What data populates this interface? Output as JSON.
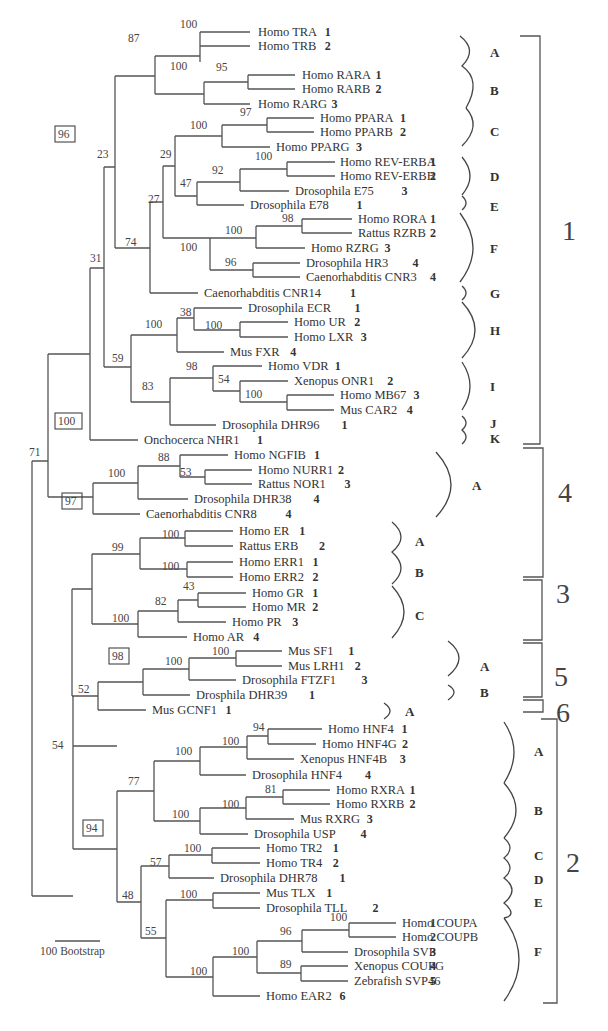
{
  "figure": {
    "type": "phylogenetic-tree",
    "scale_bar_label": "100 Bootstrap"
  },
  "taxa": [
    {
      "name": "Homo TRA",
      "num": "1",
      "y": 32,
      "x": 258
    },
    {
      "name": "Homo TRB",
      "num": "2",
      "y": 46,
      "x": 258
    },
    {
      "name": "Homo RARA",
      "num": "1",
      "y": 75,
      "x": 302
    },
    {
      "name": "Homo RARB",
      "num": "2",
      "y": 89,
      "x": 302
    },
    {
      "name": "Homo RARG",
      "num": "3",
      "y": 104,
      "x": 258
    },
    {
      "name": "Homo PPARA",
      "num": "1",
      "y": 118,
      "x": 320
    },
    {
      "name": "Homo PPARB",
      "num": "2",
      "y": 132,
      "x": 320
    },
    {
      "name": "Homo PPARG",
      "num": "3",
      "y": 147,
      "x": 276
    },
    {
      "name": "Homo REV-ERBA",
      "num": "1",
      "y": 162,
      "x": 340
    },
    {
      "name": "Homo REV-ERBB",
      "num": "2",
      "y": 176,
      "x": 340
    },
    {
      "name": "Drosophila E75",
      "num": "3",
      "y": 191,
      "x": 295
    },
    {
      "name": "Drosophila E78",
      "num": "1",
      "y": 205,
      "x": 250
    },
    {
      "name": "Homo RORA",
      "num": "1",
      "y": 219,
      "x": 358
    },
    {
      "name": "Rattus RZRB",
      "num": "2",
      "y": 233,
      "x": 358
    },
    {
      "name": "Homo RZRG",
      "num": "3",
      "y": 248,
      "x": 311
    },
    {
      "name": "Drosophila HR3",
      "num": "4",
      "y": 263,
      "x": 306
    },
    {
      "name": "Caenorhabditis CNR3",
      "num": "4",
      "y": 277,
      "x": 306
    },
    {
      "name": "Caenorhabditis CNR14",
      "num": "1",
      "y": 293,
      "x": 204
    },
    {
      "name": "Drosophila ECR",
      "num": "1",
      "y": 308,
      "x": 248
    },
    {
      "name": "Homo UR",
      "num": "2",
      "y": 322,
      "x": 294
    },
    {
      "name": "Homo LXR",
      "num": "3",
      "y": 337,
      "x": 294
    },
    {
      "name": "Mus FXR",
      "num": "4",
      "y": 352,
      "x": 230
    },
    {
      "name": "Homo VDR",
      "num": "1",
      "y": 366,
      "x": 268
    },
    {
      "name": "Xenopus ONR1",
      "num": "2",
      "y": 381,
      "x": 294
    },
    {
      "name": "Homo MB67",
      "num": "3",
      "y": 395,
      "x": 340
    },
    {
      "name": "Mus CAR2",
      "num": "4",
      "y": 410,
      "x": 340
    },
    {
      "name": "Drosophila DHR96",
      "num": "1",
      "y": 425,
      "x": 222
    },
    {
      "name": "Onchocerca NHR1",
      "num": "1",
      "y": 440,
      "x": 144
    },
    {
      "name": "Homo NGFIB",
      "num": "1",
      "y": 455,
      "x": 234
    },
    {
      "name": "Homo NURR1",
      "num": "2",
      "y": 470,
      "x": 258
    },
    {
      "name": "Rattus NOR1",
      "num": "3",
      "y": 484,
      "x": 258
    },
    {
      "name": "Drosophila DHR38",
      "num": "4",
      "y": 499,
      "x": 194
    },
    {
      "name": "Caenorhabditis CNR8",
      "num": "4",
      "y": 514,
      "x": 146
    },
    {
      "name": "Homo ER",
      "num": "1",
      "y": 531,
      "x": 239
    },
    {
      "name": "Rattus ERB",
      "num": "2",
      "y": 546,
      "x": 239
    },
    {
      "name": "Homo ERR1",
      "num": "1",
      "y": 562,
      "x": 239
    },
    {
      "name": "Homo ERR2",
      "num": "2",
      "y": 577,
      "x": 239
    },
    {
      "name": "Homo GR",
      "num": "1",
      "y": 593,
      "x": 252
    },
    {
      "name": "Homo MR",
      "num": "2",
      "y": 607,
      "x": 252
    },
    {
      "name": "Homo PR",
      "num": "3",
      "y": 622,
      "x": 232
    },
    {
      "name": "Homo AR",
      "num": "4",
      "y": 637,
      "x": 193
    },
    {
      "name": "Mus SF1",
      "num": "1",
      "y": 651,
      "x": 288
    },
    {
      "name": "Mus LRH1",
      "num": "2",
      "y": 666,
      "x": 288
    },
    {
      "name": "Drosophila FTZF1",
      "num": "3",
      "y": 680,
      "x": 242
    },
    {
      "name": "Drosphila DHR39",
      "num": "1",
      "y": 695,
      "x": 196
    },
    {
      "name": "Mus GCNF1",
      "num": "1",
      "y": 710,
      "x": 152
    },
    {
      "name": "Homo HNF4",
      "num": "1",
      "y": 729,
      "x": 328
    },
    {
      "name": "Homo HNF4G",
      "num": "2",
      "y": 744,
      "x": 322
    },
    {
      "name": "Xenopus HNF4B",
      "num": "3",
      "y": 759,
      "x": 300
    },
    {
      "name": "Drosophila HNF4",
      "num": "4",
      "y": 775,
      "x": 252
    },
    {
      "name": "Homo RXRA",
      "num": "1",
      "y": 790,
      "x": 336
    },
    {
      "name": "Homo RXRB",
      "num": "2",
      "y": 804,
      "x": 336
    },
    {
      "name": "Mus RXRG",
      "num": "3",
      "y": 819,
      "x": 300
    },
    {
      "name": "Drosophila USP",
      "num": "4",
      "y": 834,
      "x": 254
    },
    {
      "name": "Homo TR2",
      "num": "1",
      "y": 848,
      "x": 266
    },
    {
      "name": "Homo TR4",
      "num": "2",
      "y": 863,
      "x": 266
    },
    {
      "name": "Drosophila DHR78",
      "num": "1",
      "y": 878,
      "x": 220
    },
    {
      "name": "Mus TLX",
      "num": "1",
      "y": 893,
      "x": 266
    },
    {
      "name": "Drosophila TLL",
      "num": "2",
      "y": 908,
      "x": 266
    },
    {
      "name": "Homo COUPA",
      "num": "1",
      "y": 923,
      "x": 402
    },
    {
      "name": "Homo COUPB",
      "num": "2",
      "y": 937,
      "x": 402
    },
    {
      "name": "Drosophila SVP",
      "num": "3",
      "y": 952,
      "x": 354
    },
    {
      "name": "Xenopus COUPG",
      "num": "4",
      "y": 966,
      "x": 354
    },
    {
      "name": "Zebrafish SVP46",
      "num": "5",
      "y": 981,
      "x": 354
    },
    {
      "name": "Homo EAR2",
      "num": "6",
      "y": 996,
      "x": 266
    }
  ],
  "bootstrap_labels": [
    {
      "v": "100",
      "x": 180,
      "y": 28
    },
    {
      "v": "87",
      "x": 128,
      "y": 42
    },
    {
      "v": "95",
      "x": 216,
      "y": 71
    },
    {
      "v": "100",
      "x": 170,
      "y": 70
    },
    {
      "v": "97",
      "x": 240,
      "y": 116
    },
    {
      "v": "100",
      "x": 190,
      "y": 129
    },
    {
      "v": "23",
      "x": 97,
      "y": 158
    },
    {
      "v": "29",
      "x": 160,
      "y": 158
    },
    {
      "v": "100",
      "x": 255,
      "y": 160
    },
    {
      "v": "92",
      "x": 212,
      "y": 174
    },
    {
      "v": "47",
      "x": 180,
      "y": 187
    },
    {
      "v": "27",
      "x": 148,
      "y": 203
    },
    {
      "v": "98",
      "x": 282,
      "y": 222
    },
    {
      "v": "100",
      "x": 225,
      "y": 234
    },
    {
      "v": "74",
      "x": 125,
      "y": 246
    },
    {
      "v": "100",
      "x": 180,
      "y": 251
    },
    {
      "v": "96",
      "x": 225,
      "y": 266
    },
    {
      "v": "31",
      "x": 90,
      "y": 262
    },
    {
      "v": "38",
      "x": 180,
      "y": 316
    },
    {
      "v": "100",
      "x": 145,
      "y": 328
    },
    {
      "v": "100",
      "x": 205,
      "y": 329
    },
    {
      "v": "59",
      "x": 112,
      "y": 362
    },
    {
      "v": "98",
      "x": 186,
      "y": 370
    },
    {
      "v": "54",
      "x": 218,
      "y": 383
    },
    {
      "v": "83",
      "x": 142,
      "y": 390
    },
    {
      "v": "100",
      "x": 245,
      "y": 398
    },
    {
      "v": "71",
      "x": 29,
      "y": 456
    },
    {
      "v": "88",
      "x": 158,
      "y": 461
    },
    {
      "v": "100",
      "x": 108,
      "y": 477
    },
    {
      "v": "53",
      "x": 180,
      "y": 476
    },
    {
      "v": "100",
      "x": 162,
      "y": 538
    },
    {
      "v": "99",
      "x": 112,
      "y": 551
    },
    {
      "v": "100",
      "x": 162,
      "y": 570
    },
    {
      "v": "43",
      "x": 183,
      "y": 590
    },
    {
      "v": "82",
      "x": 155,
      "y": 605
    },
    {
      "v": "100",
      "x": 112,
      "y": 622
    },
    {
      "v": "100",
      "x": 212,
      "y": 655
    },
    {
      "v": "100",
      "x": 165,
      "y": 665
    },
    {
      "v": "52",
      "x": 78,
      "y": 693
    },
    {
      "v": "94",
      "x": 253,
      "y": 731
    },
    {
      "v": "100",
      "x": 222,
      "y": 745
    },
    {
      "v": "100",
      "x": 175,
      "y": 755
    },
    {
      "v": "54",
      "x": 52,
      "y": 749
    },
    {
      "v": "77",
      "x": 128,
      "y": 785
    },
    {
      "v": "81",
      "x": 265,
      "y": 793
    },
    {
      "v": "100",
      "x": 222,
      "y": 808
    },
    {
      "v": "100",
      "x": 172,
      "y": 818
    },
    {
      "v": "100",
      "x": 184,
      "y": 852
    },
    {
      "v": "57",
      "x": 150,
      "y": 866
    },
    {
      "v": "48",
      "x": 122,
      "y": 899
    },
    {
      "v": "100",
      "x": 180,
      "y": 898
    },
    {
      "v": "100",
      "x": 330,
      "y": 921
    },
    {
      "v": "55",
      "x": 145,
      "y": 935
    },
    {
      "v": "96",
      "x": 280,
      "y": 935
    },
    {
      "v": "100",
      "x": 232,
      "y": 955
    },
    {
      "v": "89",
      "x": 280,
      "y": 968
    },
    {
      "v": "100",
      "x": 190,
      "y": 975
    }
  ],
  "boxed_bootstrap": [
    {
      "v": "96",
      "x": 58,
      "y": 138
    },
    {
      "v": "100",
      "x": 58,
      "y": 425
    },
    {
      "v": "97",
      "x": 65,
      "y": 505
    },
    {
      "v": "98",
      "x": 112,
      "y": 660
    },
    {
      "v": "94",
      "x": 86,
      "y": 832
    }
  ],
  "subgroups": [
    {
      "label": "A",
      "y": 52
    },
    {
      "label": "B",
      "y": 90
    },
    {
      "label": "C",
      "y": 131
    },
    {
      "label": "D",
      "y": 176
    },
    {
      "label": "E",
      "y": 206
    },
    {
      "label": "F",
      "y": 248
    },
    {
      "label": "G",
      "y": 293
    },
    {
      "label": "H",
      "y": 330
    },
    {
      "label": "I",
      "y": 386
    },
    {
      "label": "J",
      "y": 423
    },
    {
      "label": "K",
      "y": 438
    },
    {
      "label": "A",
      "y": 485
    },
    {
      "label": "A",
      "y": 541
    },
    {
      "label": "B",
      "y": 572
    },
    {
      "label": "C",
      "y": 615
    },
    {
      "label": "A",
      "y": 666
    },
    {
      "label": "B",
      "y": 692
    },
    {
      "label": "A",
      "y": 711
    },
    {
      "label": "A",
      "y": 751
    },
    {
      "label": "B",
      "y": 810
    },
    {
      "label": "C",
      "y": 855
    },
    {
      "label": "D",
      "y": 879
    },
    {
      "label": "E",
      "y": 902
    },
    {
      "label": "F",
      "y": 951
    }
  ],
  "groups": [
    {
      "label": "1",
      "y": 230
    },
    {
      "label": "4",
      "y": 492
    },
    {
      "label": "3",
      "y": 593
    },
    {
      "label": "5",
      "y": 676
    },
    {
      "label": "6",
      "y": 712
    },
    {
      "label": "2",
      "y": 862
    }
  ]
}
